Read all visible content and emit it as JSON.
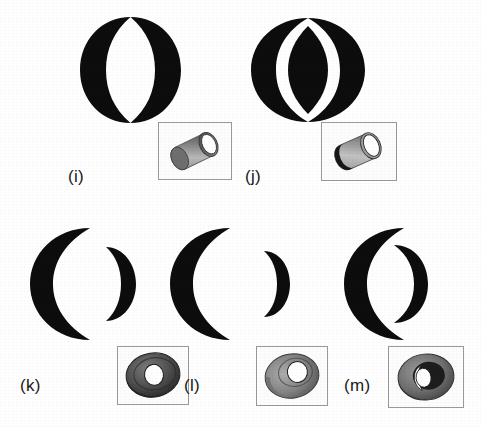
{
  "page": {
    "background_color": "#ffffff",
    "ink_color": "#0d0d0d",
    "label_color": "#1a1a1a",
    "width": 481,
    "height": 427
  },
  "figures": [
    {
      "id": "i",
      "label": "(i)",
      "silhouette_name": "two-crescents-facing-forming-ring",
      "silhouette_desc": "Large black ring-like outline: two back-to-back crescents meeting at top and bottom, enclosing a white lens-shaped gap",
      "inset_name": "tube-inset-i",
      "inset_desc": "Short grey cylindrical tube seen obliquely with white elliptical opening at right end"
    },
    {
      "id": "j",
      "label": "(j)",
      "silhouette_name": "two-crescents-with-central-lens",
      "silhouette_desc": "Two black crescents flanking a solid black lens (pointed oval) at centre, separated by white gaps",
      "inset_name": "tube-inset-j",
      "inset_desc": "Grey cylindrical tube seen obliquely with dark near rim and white elliptical opening"
    },
    {
      "id": "k",
      "label": "(k)",
      "silhouette_name": "large-crescent-and-separate-small-crescent",
      "silhouette_desc": "Large black crescent opening rightward beside a smaller separate crescent opening leftward",
      "inset_name": "torus-inset-k",
      "inset_desc": "Dark grey torus viewed obliquely with a small white hole at its centre"
    },
    {
      "id": "l",
      "label": "(l)",
      "silhouette_name": "large-crescent-and-distant-small-crescent",
      "silhouette_desc": "Large black crescent opening rightward with a smaller crescent placed further away to the right",
      "inset_name": "torus-inset-l",
      "inset_desc": "Light grey torus viewed obliquely with a white hole offset to the upper right"
    },
    {
      "id": "m",
      "label": "(m)",
      "silhouette_name": "overlapping-large-and-small-crescents",
      "silhouette_desc": "Large black crescent with a smaller crescent overlapping inside its opening, forming a figure like a numeral six",
      "inset_name": "torus-inset-m",
      "inset_desc": "Grey torus viewed obliquely with white crescent-shaped highlight on the left of the hole"
    }
  ]
}
